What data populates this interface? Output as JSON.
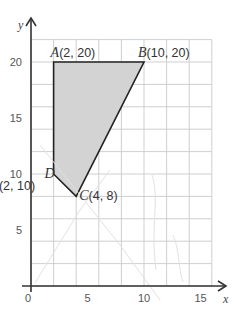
{
  "chart_data": {
    "type": "polygon-on-grid",
    "title": "",
    "xlabel": "x",
    "ylabel": "y",
    "xlim": [
      0,
      16
    ],
    "ylim": [
      0,
      22
    ],
    "grid": true,
    "grid_step": 2,
    "x_ticks": [
      0,
      5,
      10,
      15
    ],
    "y_ticks": [
      5,
      10,
      15,
      20
    ],
    "origin_label": "0",
    "points": [
      {
        "name": "A",
        "x": 2,
        "y": 20,
        "label": "A",
        "coords": "(2,  20)"
      },
      {
        "name": "B",
        "x": 10,
        "y": 20,
        "label": "B",
        "coords": "(10, 20)"
      },
      {
        "name": "C",
        "x": 4,
        "y": 8,
        "label": "C",
        "coords": "(4, 8)"
      },
      {
        "name": "D",
        "x": 2,
        "y": 10,
        "label": "D",
        "coords": "(2, 10)"
      }
    ],
    "polygon": [
      "A",
      "B",
      "C",
      "D"
    ],
    "fill_color": "#d3d3d3",
    "stroke_color": "#222222",
    "grid_color": "#c9c9c9"
  }
}
